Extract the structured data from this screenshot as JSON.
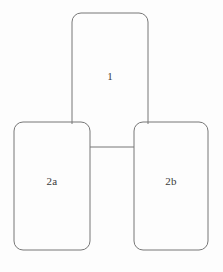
{
  "diagram": {
    "background_color": "#fdfdfd",
    "stroke_color": "#777777",
    "stroke_width": 1,
    "label_color": "#3a3a3a",
    "corner_radius": 9,
    "nodes": [
      {
        "id": "node-1",
        "label": "1",
        "shape": "rounded-rectangle-open-bottom",
        "x": 72,
        "y": 13,
        "width": 76,
        "height": 111,
        "label_x": 110,
        "label_y": 76
      },
      {
        "id": "node-2a",
        "label": "2a",
        "shape": "rounded-rectangle",
        "x": 14,
        "y": 122,
        "width": 76,
        "height": 128,
        "label_x": 52,
        "label_y": 181
      },
      {
        "id": "node-2b",
        "label": "2b",
        "shape": "rounded-rectangle",
        "x": 134,
        "y": 122,
        "width": 74,
        "height": 128,
        "label_x": 171,
        "label_y": 181
      }
    ],
    "connectors": [
      {
        "id": "connector-2a-2b",
        "orientation": "horizontal",
        "x1": 90,
        "y1": 147,
        "x2": 134,
        "y2": 147
      }
    ]
  }
}
